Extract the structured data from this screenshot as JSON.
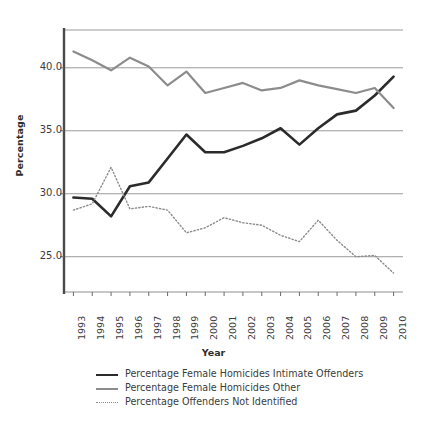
{
  "chart_data": {
    "type": "line",
    "title": "",
    "xlabel": "Year",
    "ylabel": "Percentage",
    "grid": true,
    "legend_position": "bottom",
    "ylim": [
      22.2,
      43.0
    ],
    "yticks": [
      "25.0",
      "30.0",
      "35.0",
      "40.0"
    ],
    "ytick_values": [
      25.0,
      30.0,
      35.0,
      40.0
    ],
    "categories": [
      "1993",
      "1994",
      "1995",
      "1996",
      "1997",
      "1998",
      "1999",
      "2000",
      "2001",
      "2002",
      "2003",
      "2004",
      "2005",
      "2006",
      "2007",
      "2008",
      "2009",
      "2010"
    ],
    "series": [
      {
        "name": "Percentage Female Homicides Intimate Offenders",
        "style": "solid",
        "color": "#2b2b2b",
        "width": 2.6,
        "values": [
          29.7,
          29.6,
          28.2,
          30.6,
          30.9,
          32.8,
          34.7,
          33.3,
          33.3,
          33.8,
          34.4,
          35.2,
          33.9,
          35.2,
          36.3,
          36.6,
          37.8,
          39.3
        ]
      },
      {
        "name": "Percentage Female Homicides Other",
        "style": "solid",
        "color": "#8c8c8c",
        "width": 2.2,
        "values": [
          41.3,
          40.6,
          39.8,
          40.8,
          40.1,
          38.6,
          39.7,
          38.0,
          38.4,
          38.8,
          38.2,
          38.4,
          39.0,
          38.6,
          38.3,
          38.0,
          38.4,
          36.8
        ]
      },
      {
        "name": "Percentage Offenders Not Identified",
        "style": "dotted",
        "color": "#8a8a8a",
        "width": 1.4,
        "values": [
          28.7,
          29.2,
          32.1,
          28.8,
          29.0,
          28.7,
          26.9,
          27.3,
          28.1,
          27.7,
          27.5,
          26.7,
          26.2,
          27.9,
          26.3,
          25.0,
          25.1,
          23.7
        ]
      }
    ]
  },
  "axes": {
    "y_title": "Percentage",
    "x_title": "Year"
  },
  "legend": {
    "items": [
      {
        "label": "Percentage Female Homicides Intimate Offenders",
        "swatch": "solid-dark-line-swatch"
      },
      {
        "label": "Percentage Female Homicides Other",
        "swatch": "solid-grey-line-swatch"
      },
      {
        "label": "Percentage Offenders Not Identified",
        "swatch": "dotted-grey-line-swatch"
      }
    ]
  }
}
